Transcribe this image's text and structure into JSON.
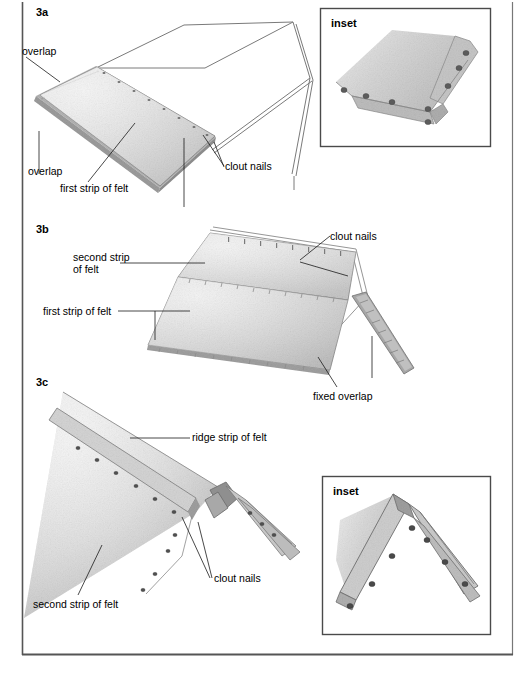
{
  "page": {
    "width": 526,
    "height": 673,
    "background": "#ffffff",
    "border_color": "#5a5a5a"
  },
  "colors": {
    "felt_light": "#dcdcdc",
    "felt_mid": "#c9c9c9",
    "felt_dark": "#a8a8a8",
    "felt_edge": "#8f8f8f",
    "outline": "#4a4a4a",
    "nail": "#555555",
    "leader_line": "#1a1a1a",
    "text": "#000000"
  },
  "figures": [
    {
      "id": "3a",
      "label": "3a",
      "callouts": [
        {
          "name": "overlap-top",
          "text": "overlap"
        },
        {
          "name": "overlap-bottom",
          "text": "overlap"
        },
        {
          "name": "first-strip-of-felt",
          "text": "first strip of felt"
        },
        {
          "name": "clout-nails",
          "text": "clout nails"
        }
      ]
    },
    {
      "id": "3b",
      "label": "3b",
      "callouts": [
        {
          "name": "second-strip-of-felt",
          "text": "second strip\nof felt"
        },
        {
          "name": "first-strip-of-felt",
          "text": "first strip of felt"
        },
        {
          "name": "clout-nails",
          "text": "clout nails"
        },
        {
          "name": "fixed-overlap",
          "text": "fixed overlap"
        }
      ]
    },
    {
      "id": "3c",
      "label": "3c",
      "callouts": [
        {
          "name": "ridge-strip-of-felt",
          "text": "ridge strip of felt"
        },
        {
          "name": "second-strip-of-felt",
          "text": "second strip of felt"
        },
        {
          "name": "clout-nails",
          "text": "clout nails"
        }
      ]
    }
  ],
  "insets": [
    {
      "name": "inset-top-right",
      "label": "inset"
    },
    {
      "name": "inset-bottom-right",
      "label": "inset"
    }
  ],
  "labels": {
    "fig_3a": "3a",
    "fig_3b": "3b",
    "fig_3c": "3c",
    "overlap_top": "overlap",
    "overlap_bottom": "overlap",
    "first_strip_3a": "first strip of felt",
    "clout_nails_3a": "clout nails",
    "second_strip_3b_line1": "second strip",
    "second_strip_3b_line2": "of felt",
    "first_strip_3b": "first strip of felt",
    "clout_nails_3b": "clout nails",
    "fixed_overlap_3b": "fixed overlap",
    "ridge_strip_3c": "ridge strip of felt",
    "clout_nails_3c": "clout nails",
    "second_strip_3c": "second strip of felt",
    "inset_1": "inset",
    "inset_2": "inset"
  }
}
